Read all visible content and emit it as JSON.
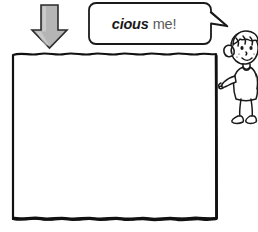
{
  "page": {
    "background_color": "#ffffff",
    "width": 258,
    "height": 232
  },
  "speech_bubble": {
    "name": "speech-bubble",
    "text_fragment": "cious",
    "text_rest": "me!",
    "full_text": "cious me!",
    "fill_color": "#ffffff",
    "stroke_color": "#1a1a1a",
    "tail_direction": "right"
  },
  "arrow": {
    "name": "down-arrow",
    "direction": "down",
    "fill_color": "#b5b5b5",
    "stroke_color": "#2b2b2b"
  },
  "answer_box": {
    "name": "answer-box",
    "style": "hand-drawn-wavy",
    "fill_color": "#ffffff",
    "stroke_color": "#111111",
    "content": ""
  },
  "character": {
    "name": "cartoon-girl",
    "description": "cartoon girl with ponytail pointing left",
    "stroke_color": "#1a1a1a",
    "fill_color": "#ffffff"
  }
}
